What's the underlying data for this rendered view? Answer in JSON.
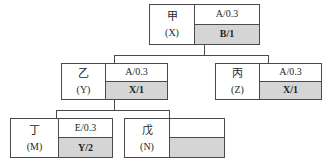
{
  "diagram": {
    "type": "tree",
    "title": "",
    "nodes": [
      {
        "id": "jia",
        "name": "甲",
        "alias": "(X)",
        "top_cell": "A/0.3",
        "bottom_cell": "B/1",
        "top_shaded": false,
        "bottom_shaded": true,
        "level": 0
      },
      {
        "id": "yi",
        "name": "乙",
        "alias": "(Y)",
        "top_cell": "A/0.3",
        "bottom_cell": "X/1",
        "top_shaded": false,
        "bottom_shaded": true,
        "level": 1
      },
      {
        "id": "bing",
        "name": "丙",
        "alias": "(Z)",
        "top_cell": "A/0.3",
        "bottom_cell": "X/1",
        "top_shaded": false,
        "bottom_shaded": true,
        "level": 1
      },
      {
        "id": "ding",
        "name": "丁",
        "alias": "(M)",
        "top_cell": "E/0.3",
        "bottom_cell": "Y/2",
        "top_shaded": false,
        "bottom_shaded": true,
        "level": 2
      },
      {
        "id": "wu",
        "name": "戊",
        "alias": "(N)",
        "top_cell": "",
        "bottom_cell": "",
        "top_shaded": false,
        "bottom_shaded": true,
        "level": 2
      }
    ],
    "edges": [
      {
        "from": "jia",
        "to": "yi"
      },
      {
        "from": "jia",
        "to": "bing"
      },
      {
        "from": "yi",
        "to": "ding"
      },
      {
        "from": "yi",
        "to": "wu"
      }
    ],
    "colors": {
      "shade": "#d5d5d5",
      "line": "#4a4a4a",
      "text": "#1f1f1f",
      "background": "#ffffff"
    }
  }
}
